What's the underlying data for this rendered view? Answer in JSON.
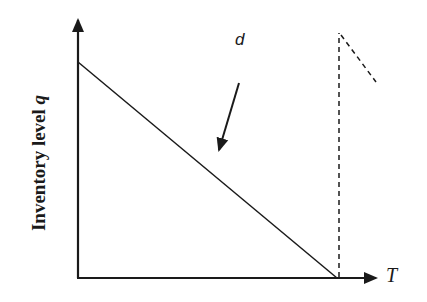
{
  "diagram": {
    "y_axis_label": "Inventory level",
    "y_axis_variable": "q",
    "x_axis_label": "T",
    "rate_label": "d",
    "colors": {
      "stroke": "#1a1a1a",
      "background": "#ffffff"
    },
    "elements": [
      {
        "type": "axis",
        "name": "y-axis",
        "from": [
          78,
          278
        ],
        "to": [
          78,
          18
        ]
      },
      {
        "type": "axis",
        "name": "x-axis",
        "from": [
          78,
          278
        ],
        "to": [
          378,
          278
        ]
      },
      {
        "type": "line",
        "style": "solid",
        "name": "depletion-line",
        "from": [
          78,
          62
        ],
        "to": [
          337,
          278
        ]
      },
      {
        "type": "line",
        "style": "dashed",
        "name": "replenishment-line",
        "from": [
          339,
          278
        ],
        "to": [
          339,
          33
        ]
      },
      {
        "type": "line",
        "style": "dashed",
        "name": "next-cycle-line",
        "from": [
          341,
          35
        ],
        "to": [
          376,
          82
        ]
      },
      {
        "type": "arrow",
        "name": "demand-rate-arrow",
        "from": [
          239,
          83
        ],
        "to": [
          218,
          150
        ]
      }
    ]
  }
}
